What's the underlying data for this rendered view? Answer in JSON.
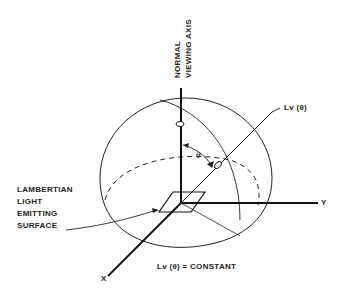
{
  "figure": {
    "type": "3D hemisphere diagram",
    "colors": {
      "line": "#222222",
      "background": "#ffffff"
    }
  },
  "axes": {
    "normal_axis_line1": "NORMAL",
    "normal_axis_line2": "VIEWING AXIS",
    "x_label": "X",
    "y_label": "Y"
  },
  "labels": {
    "luminance": "Lv (θ)",
    "theta": "θ",
    "surface_line1": "LAMBERTIAN",
    "surface_line2": "LIGHT",
    "surface_line3": "EMITTING",
    "surface_line4": "SURFACE",
    "equation": "Lv (θ) = CONSTANT"
  }
}
